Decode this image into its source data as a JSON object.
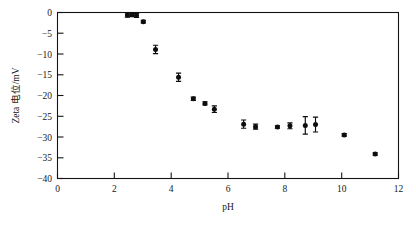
{
  "figure": {
    "background_color": "#ffffff",
    "foreground_color": "#141414",
    "marker_color": "#0d0d0d"
  },
  "axes": {
    "x_title": "pH",
    "y_title": "Zeta 电位/mV",
    "x_ticks": [
      "0",
      "2",
      "4",
      "6",
      "8",
      "10",
      "12"
    ],
    "y_ticks": [
      "0",
      "−5",
      "−10",
      "−15",
      "−20",
      "−25",
      "−30",
      "−35",
      "−40"
    ]
  },
  "caption": {
    "ghost_line": ""
  },
  "chart_data": {
    "type": "scatter",
    "title": "",
    "xlabel": "pH",
    "ylabel": "Zeta 电位/mV",
    "xlim": [
      0,
      12
    ],
    "ylim": [
      -40,
      0
    ],
    "xticks": [
      0,
      2,
      4,
      6,
      8,
      10,
      12
    ],
    "yticks": [
      -40,
      -35,
      -30,
      -25,
      -20,
      -15,
      -10,
      -5,
      0
    ],
    "grid": false,
    "legend": null,
    "marker": "filled-circle",
    "error_bars": "vertical",
    "series": [
      {
        "name": "Zeta potential",
        "points": [
          {
            "x": 2.46,
            "y": -0.6,
            "yerr": 0.5
          },
          {
            "x": 2.62,
            "y": -0.5,
            "yerr": 0.5
          },
          {
            "x": 2.78,
            "y": -0.7,
            "yerr": 0.5
          },
          {
            "x": 3.02,
            "y": -2.2,
            "yerr": 0.3
          },
          {
            "x": 3.45,
            "y": -8.9,
            "yerr": 1.0
          },
          {
            "x": 4.26,
            "y": -15.6,
            "yerr": 1.0
          },
          {
            "x": 4.78,
            "y": -20.8,
            "yerr": 0.4
          },
          {
            "x": 5.19,
            "y": -21.9,
            "yerr": 0.4
          },
          {
            "x": 5.52,
            "y": -23.3,
            "yerr": 0.8
          },
          {
            "x": 6.55,
            "y": -26.9,
            "yerr": 1.0
          },
          {
            "x": 6.97,
            "y": -27.5,
            "yerr": 0.6
          },
          {
            "x": 7.74,
            "y": -27.6,
            "yerr": 0.3
          },
          {
            "x": 8.18,
            "y": -27.3,
            "yerr": 0.7
          },
          {
            "x": 8.72,
            "y": -27.2,
            "yerr": 2.1
          },
          {
            "x": 9.08,
            "y": -27.0,
            "yerr": 1.8
          },
          {
            "x": 10.09,
            "y": -29.5,
            "yerr": 0.3
          },
          {
            "x": 11.18,
            "y": -34.1,
            "yerr": 0.3
          }
        ]
      }
    ]
  }
}
